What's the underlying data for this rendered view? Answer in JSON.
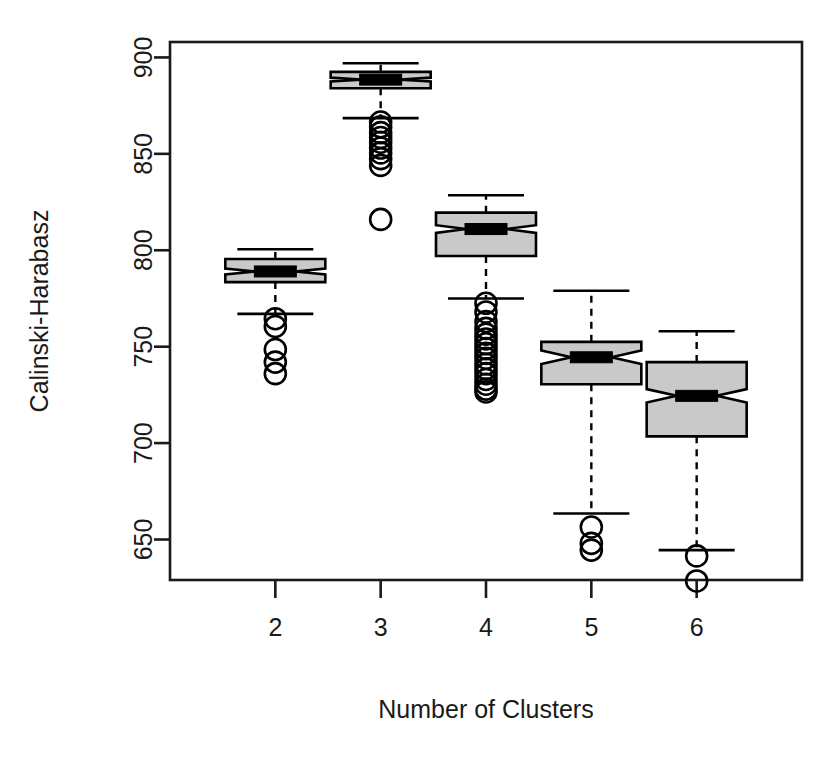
{
  "chart_data": {
    "type": "box",
    "title": "",
    "xlabel": "Number of Clusters",
    "ylabel": "Calinski-Harabasz",
    "categories": [
      "2",
      "3",
      "4",
      "5",
      "6"
    ],
    "x_tick_labels": [
      "2",
      "3",
      "4",
      "5",
      "6"
    ],
    "y_tick_labels": [
      "650",
      "700",
      "750",
      "800",
      "850",
      "900"
    ],
    "y_ticks": [
      650,
      700,
      750,
      800,
      850,
      900
    ],
    "ylim": [
      629,
      908
    ],
    "xlim": [
      1.5,
      6.5
    ],
    "grid": false,
    "legend": null,
    "notched": true,
    "box_fill_color": "#c9c9c9",
    "box_line_color": "#000000",
    "median_color": "#000000",
    "series": [
      {
        "name": "2",
        "category": "2",
        "lower_whisker": 767.0,
        "q1": 783.5,
        "median": 789.0,
        "q3": 795.5,
        "upper_whisker": 800.5,
        "notch_lower": 787.5,
        "notch_upper": 790.5,
        "outliers": [
          764.5,
          760.5,
          748.5,
          742.0,
          736.0
        ]
      },
      {
        "name": "3",
        "category": "3",
        "lower_whisker": 868.5,
        "q1": 884.0,
        "median": 888.5,
        "q3": 892.5,
        "upper_whisker": 897.0,
        "notch_lower": 887.5,
        "notch_upper": 889.5,
        "outliers": [
          866.5,
          864.0,
          861.0,
          858.5,
          856.0,
          853.0,
          850.5,
          847.5,
          844.0,
          816.0
        ]
      },
      {
        "name": "4",
        "category": "4",
        "lower_whisker": 775.0,
        "q1": 797.0,
        "median": 811.0,
        "q3": 819.5,
        "upper_whisker": 828.5,
        "notch_lower": 809.0,
        "notch_upper": 813.0,
        "outliers": [
          772.5,
          768.0,
          763.0,
          759.5,
          756.5,
          754.0,
          751.5,
          749.0,
          746.5,
          744.0,
          741.0,
          738.5,
          736.0,
          733.0,
          730.5,
          728.0,
          726.5
        ]
      },
      {
        "name": "5",
        "category": "5",
        "lower_whisker": 663.5,
        "q1": 730.5,
        "median": 744.5,
        "q3": 752.5,
        "upper_whisker": 779.0,
        "notch_lower": 741.0,
        "notch_upper": 748.0,
        "outliers": [
          656.5,
          648.0,
          644.5
        ]
      },
      {
        "name": "6",
        "category": "6",
        "lower_whisker": 644.5,
        "q1": 703.5,
        "median": 724.5,
        "q3": 742.0,
        "upper_whisker": 758.0,
        "notch_lower": 721.0,
        "notch_upper": 728.0,
        "outliers": [
          641.5,
          628.5
        ]
      }
    ]
  },
  "axis": {
    "y_title": "Calinski-Harabasz",
    "x_title": "Number of Clusters"
  }
}
